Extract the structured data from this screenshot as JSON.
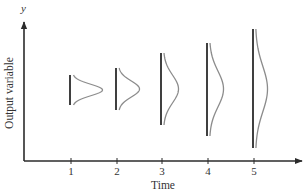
{
  "figure": {
    "y_axis_symbol": "y",
    "y_axis_label": "Output variable",
    "x_axis_label": "Time",
    "axis_color": "#2b2b2b",
    "bar_color": "#2b2b2b",
    "curve_color": "#8c8c8c",
    "distributions": [
      {
        "time_label": "1",
        "x": 71,
        "top": 75,
        "bottom": 105,
        "center": 90,
        "peak": 30
      },
      {
        "time_label": "2",
        "x": 117,
        "top": 68,
        "bottom": 110,
        "center": 89,
        "peak": 21
      },
      {
        "time_label": "3",
        "x": 162,
        "top": 53,
        "bottom": 125,
        "center": 89,
        "peak": 15
      },
      {
        "time_label": "4",
        "x": 208,
        "top": 43,
        "bottom": 136,
        "center": 89,
        "peak": 14
      },
      {
        "time_label": "5",
        "x": 254,
        "top": 29,
        "bottom": 148,
        "center": 89,
        "peak": 12
      }
    ]
  }
}
